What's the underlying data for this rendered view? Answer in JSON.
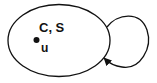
{
  "diagram": {
    "type": "state-self-loop",
    "state": {
      "label": "C, S",
      "point_label": "u",
      "shape": "ellipse"
    },
    "self_loop": {
      "direction": "clockwise",
      "arrowhead": "returns-to-state"
    },
    "colors": {
      "stroke": "#111111",
      "background": "#ffffff"
    }
  }
}
